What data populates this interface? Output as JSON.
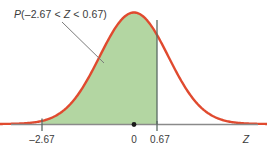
{
  "figure": {
    "title": "",
    "annotation_label": "P(–2.67 < Z < 0.67)",
    "annotation_parts": {
      "p": "P",
      "open": "(–2.67 < ",
      "z": "Z",
      "close": " < 0.67)"
    },
    "axis_name": "Z",
    "colors": {
      "curve": "#e04a2f",
      "fill": "#b3d6a2",
      "axis": "#8a8a8a",
      "boundary": "#5a6a63",
      "text": "#3b3b3b",
      "background": "#ffffff"
    }
  },
  "chart_data": {
    "type": "area",
    "title": "",
    "subtitle": "",
    "xlabel": "Z",
    "ylabel": "",
    "grid": false,
    "legend": null,
    "distribution": "standard normal",
    "mean": 0,
    "sd": 1,
    "xlim": [
      -3.9,
      3.9
    ],
    "ylim": [
      0,
      0.42
    ],
    "shaded_region": {
      "from": -2.67,
      "to": 0.67,
      "label": "P(–2.67 < Z < 0.67)",
      "fill": "#b3d6a2"
    },
    "tick_labels": [
      "–2.67",
      "0",
      "0.67"
    ],
    "tick_values": [
      -2.67,
      0,
      0.67
    ],
    "markers": [
      {
        "x": 0,
        "type": "dot",
        "label": "0"
      }
    ],
    "boundaries": [
      {
        "x": -2.67,
        "label": "–2.67",
        "line": "short"
      },
      {
        "x": 0.67,
        "label": "0.67",
        "line": "full"
      }
    ],
    "curve": {
      "name": "standard normal density",
      "color": "#e04a2f",
      "x": [
        -3.9,
        -3.6,
        -3.3,
        -3.0,
        -2.67,
        -2.4,
        -2.1,
        -1.8,
        -1.5,
        -1.2,
        -0.9,
        -0.6,
        -0.3,
        0.0,
        0.3,
        0.6,
        0.67,
        0.9,
        1.2,
        1.5,
        1.8,
        2.1,
        2.4,
        2.7,
        3.0,
        3.3,
        3.6,
        3.9
      ],
      "y": [
        0.0002,
        0.0006,
        0.0017,
        0.0044,
        0.0113,
        0.0224,
        0.044,
        0.079,
        0.1295,
        0.1942,
        0.2661,
        0.3332,
        0.3814,
        0.3989,
        0.3814,
        0.3332,
        0.3187,
        0.2661,
        0.1942,
        0.1295,
        0.079,
        0.044,
        0.0224,
        0.0104,
        0.0044,
        0.0017,
        0.0006,
        0.0002
      ]
    }
  }
}
